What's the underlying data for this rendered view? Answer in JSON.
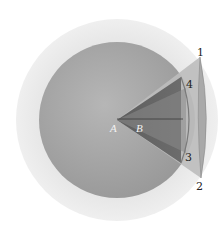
{
  "diagram": {
    "labels": {
      "center": "A",
      "inner": "B",
      "point1": "1",
      "point2": "2",
      "point3": "3",
      "point4": "4"
    },
    "colors": {
      "outer_halo": "#ebebeb",
      "sphere": "#9e9e9e",
      "sphere_highlight": "#b4b4b4",
      "outer_cone": "#b9b9b9",
      "inner_cone": "#6e6e6e",
      "inner_cone_light": "#8a8a8a",
      "cap_lens": "#a8a8a8",
      "axis_line": "#3a3a3a",
      "label_text": "#222222",
      "point_label_text": "#f2f2f2"
    }
  }
}
